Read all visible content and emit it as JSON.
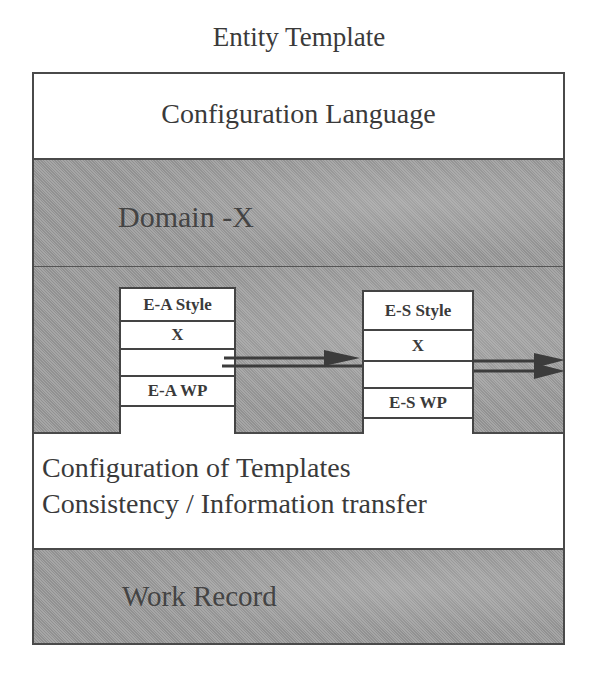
{
  "diagram": {
    "title": "Entity Template",
    "sections": {
      "configuration_language": "Configuration Language",
      "domain": "Domain -X",
      "configuration_of_templates": {
        "line1": "Configuration of Templates",
        "line2": "Consistency / Information transfer"
      },
      "work_record": "Work Record"
    },
    "entities": [
      {
        "style_label": "E-A Style",
        "variable": "X",
        "wp_label": "E-A WP"
      },
      {
        "style_label": "E-S Style",
        "variable": "X",
        "wp_label": "E-S WP"
      }
    ],
    "colors": {
      "frame": "#4a4a4a",
      "shaded_band": "#9a9a9a",
      "text": "#3a3a3a",
      "arrow": "#3c3c3c"
    }
  }
}
